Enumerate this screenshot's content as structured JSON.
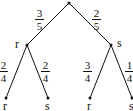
{
  "diagram": {
    "type": "probability-tree",
    "root": {
      "branches": [
        {
          "probability": {
            "numerator": "3",
            "denominator": "5"
          },
          "outcome": "r",
          "branches": [
            {
              "probability": {
                "numerator": "2",
                "denominator": "4"
              },
              "outcome": "r"
            },
            {
              "probability": {
                "numerator": "2",
                "denominator": "4"
              },
              "outcome": "s"
            }
          ]
        },
        {
          "probability": {
            "numerator": "2",
            "denominator": "5"
          },
          "outcome": "s",
          "branches": [
            {
              "probability": {
                "numerator": "3",
                "denominator": "4"
              },
              "outcome": "r"
            },
            {
              "probability": {
                "numerator": "1",
                "denominator": "4"
              },
              "outcome": "s"
            }
          ]
        }
      ]
    }
  },
  "labels": {
    "level1_left": "r",
    "level1_right": "s",
    "leaf_1": "r",
    "leaf_2": "s",
    "leaf_3": "r",
    "leaf_4": "s"
  },
  "fractions": {
    "root_left": {
      "num": "3",
      "den": "5"
    },
    "root_right": {
      "num": "2",
      "den": "5"
    },
    "r_left": {
      "num": "2",
      "den": "4"
    },
    "r_right": {
      "num": "2",
      "den": "4"
    },
    "s_left": {
      "num": "3",
      "den": "4"
    },
    "s_right": {
      "num": "1",
      "den": "4"
    }
  }
}
